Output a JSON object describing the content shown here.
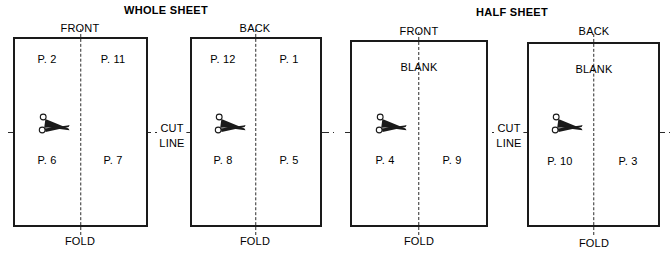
{
  "diagram": {
    "title_whole": "WHOLE SHEET",
    "title_half": "HALF SHEET",
    "cut_word_1": "CUT",
    "cut_word_2": "LINE",
    "groups": [
      {
        "name": "WHOLE SHEET",
        "panels": [
          {
            "side_label": "FRONT",
            "fold_label": "FOLD",
            "top_left": "P. 2",
            "top_right": "P. 11",
            "bottom_left": "P. 6",
            "bottom_right": "P. 7"
          },
          {
            "side_label": "BACK",
            "fold_label": "FOLD",
            "top_left": "P. 12",
            "top_right": "P. 1",
            "bottom_left": "P. 8",
            "bottom_right": "P. 5"
          }
        ]
      },
      {
        "name": "HALF SHEET",
        "panels": [
          {
            "side_label": "FRONT",
            "fold_label": "FOLD",
            "top_center": "BLANK",
            "bottom_left": "P. 4",
            "bottom_right": "P. 9"
          },
          {
            "side_label": "BACK",
            "fold_label": "FOLD",
            "top_center": "BLANK",
            "bottom_left": "P. 10",
            "bottom_right": "P. 3"
          }
        ]
      }
    ],
    "colors": {
      "ink": "#1a1a1a",
      "line": "#2b2b2b",
      "paper": "#ffffff"
    },
    "icons": {
      "scissors": "scissors-icon"
    }
  }
}
